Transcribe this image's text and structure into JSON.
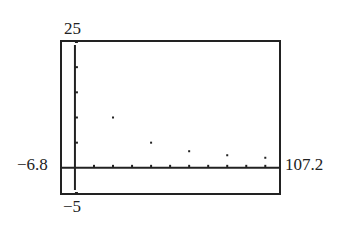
{
  "chart_data": {
    "type": "scatter",
    "title": "",
    "xlabel": "",
    "ylabel": "",
    "window": {
      "xmin": -6.8,
      "xmax": 107.2,
      "ymin": -5,
      "ymax": 25,
      "xscl": 10,
      "yscl": 5
    },
    "xlim": [
      -6.8,
      107.2
    ],
    "ylim": [
      -5,
      25
    ],
    "grid": false,
    "points": [
      {
        "x": 20,
        "y": 10
      },
      {
        "x": 40,
        "y": 5
      },
      {
        "x": 60,
        "y": 3.3
      },
      {
        "x": 80,
        "y": 2.5
      },
      {
        "x": 100,
        "y": 2
      }
    ],
    "labels": {
      "ymax": "25",
      "ymin": "−5",
      "xmin": "−6.8",
      "xmax": "107.2"
    }
  }
}
